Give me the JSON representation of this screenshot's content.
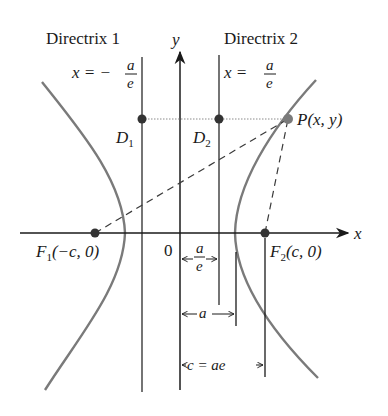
{
  "diagram": {
    "type": "hyperbola-focus-directrix",
    "colors": {
      "axis": "#1a1a1a",
      "curve": "#7a7a7a",
      "directrix": "#3a3a3a",
      "dotted": "#8a8a8a",
      "point_dark": "#333333",
      "point_P": "#7a7a7a",
      "background": "#ffffff"
    },
    "axes": {
      "x_label": "x",
      "y_label": "y",
      "origin_label": "0"
    },
    "directrices": [
      {
        "name": "Directrix 1",
        "equation_lhs": "x = −",
        "equation_num": "a",
        "equation_den": "e"
      },
      {
        "name": "Directrix 2",
        "equation_lhs": "x = ",
        "equation_num": "a",
        "equation_den": "e"
      }
    ],
    "points": {
      "D1": {
        "letter": "D",
        "sub": "1"
      },
      "D2": {
        "letter": "D",
        "sub": "2"
      },
      "P": {
        "label": "P(x, y)"
      },
      "F1": {
        "letter": "F",
        "sub": "1",
        "coords": "(−c, 0)"
      },
      "F2": {
        "letter": "F",
        "sub": "2",
        "coords": "(c, 0)"
      }
    },
    "dimensions": [
      {
        "id": "a_over_e",
        "num": "a",
        "den": "e"
      },
      {
        "id": "a",
        "label": "a"
      },
      {
        "id": "c",
        "label": "c = ae"
      }
    ]
  }
}
